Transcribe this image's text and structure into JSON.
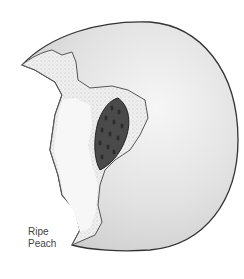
{
  "figure": {
    "caption_line1": "Ripe",
    "caption_line2": "Peach"
  },
  "colors": {
    "skin": "#e6e6e6",
    "skin_outline": "#333333",
    "flesh": "#f0f0f0",
    "pit": "#4a4a4a",
    "background": "#ffffff"
  }
}
